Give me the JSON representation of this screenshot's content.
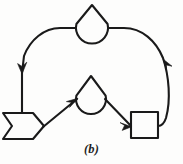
{
  "figure": {
    "caption": "(b)",
    "label": "b",
    "background_color": "#fdfdfc",
    "ink_color": "#1a1a1a",
    "width": 183,
    "height": 164
  },
  "diagram": {
    "type": "cyclic-flow-diagram",
    "node_count": 4,
    "edge_count": 5,
    "nodes": [
      {
        "id": "node-top-cone",
        "shape": "teardrop",
        "shape_description": "circle with pointed triangular apex on top",
        "name": "top-cone-node",
        "cx": 92,
        "cy": 28,
        "radius": 16,
        "apex_y": 5
      },
      {
        "id": "node-middle-cone",
        "shape": "teardrop",
        "shape_description": "circle with pointed triangular apex on top",
        "name": "middle-cone-node",
        "cx": 91,
        "cy": 99,
        "radius": 15,
        "apex_y": 76
      },
      {
        "id": "node-left-banner",
        "shape": "chevron-banner",
        "shape_description": "pentagon banner with notch on left edge and point on right edge",
        "name": "left-banner-node",
        "x": 3,
        "y": 113,
        "width": 40,
        "height": 26
      },
      {
        "id": "node-right-square",
        "shape": "square",
        "shape_description": "plain square box",
        "name": "right-square-node",
        "x": 131,
        "y": 112,
        "width": 27,
        "height": 26
      }
    ],
    "edges": [
      {
        "id": "edge-top-cone-to-banner",
        "name": "edge-top-left-arc",
        "from": "node-top-cone",
        "to": "node-left-banner",
        "style": "curved-arc",
        "direction": "leftward-then-down",
        "arrow": "down",
        "arrow_x": 23,
        "arrow_y": 68
      },
      {
        "id": "edge-square-to-top-cone",
        "name": "edge-top-right-arc",
        "from": "node-right-square",
        "to": "node-top-cone",
        "style": "curved-arc",
        "direction": "up-then-leftward",
        "arrow": "up",
        "arrow_x": 166,
        "arrow_y": 69
      },
      {
        "id": "edge-banner-to-middle-cone",
        "name": "edge-banner-diagonal",
        "from": "node-left-banner",
        "to": "node-middle-cone",
        "style": "straight-diagonal",
        "direction": "up-right",
        "arrow": "up-right",
        "arrow_x": 61,
        "arrow_y": 111
      },
      {
        "id": "edge-middle-cone-to-square",
        "name": "edge-square-diagonal",
        "from": "node-middle-cone",
        "to": "node-right-square",
        "style": "straight-diagonal",
        "direction": "down-right",
        "arrow": "down-right",
        "arrow_x": 122,
        "arrow_y": 112
      },
      {
        "id": "edge-square-tail",
        "name": "edge-square-right-stub",
        "from": "node-right-square",
        "to": "edge-top-right-arc",
        "style": "stub",
        "arrow": "none"
      }
    ]
  }
}
